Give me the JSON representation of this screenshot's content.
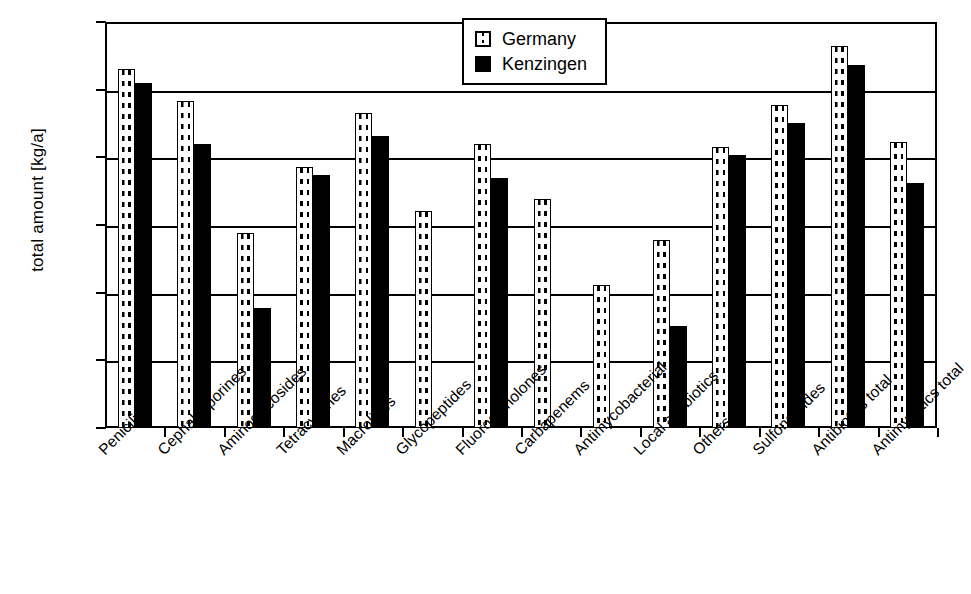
{
  "chart_data": {
    "type": "bar",
    "title": "",
    "xlabel": "",
    "ylabel": "total amount [kg/a]",
    "yscale": "log",
    "ylim": [
      1,
      1000000
    ],
    "yticks": [
      "1",
      "10",
      "100",
      "1000",
      "10000",
      "100000",
      "1000000"
    ],
    "grid": true,
    "legend_position": "top-center",
    "categories": [
      "Penicilins",
      "Cephalosporines",
      "Aminoglycosides",
      "Tetracyclines",
      "Macrolides",
      "Glycopeptides",
      "Fluoroquinolones",
      "Carbapenems",
      "Antimycobacterial",
      "Local antibiotics",
      "Others",
      "Sulfonamides",
      "Antibiotics total",
      "Antimycotics total"
    ],
    "series": [
      {
        "name": "Germany",
        "values": [
          200000,
          68000,
          750,
          7300,
          45000,
          1600,
          16000,
          2400,
          130,
          600,
          14000,
          60000,
          440000,
          17000
        ]
      },
      {
        "name": "Kenzingen",
        "values": [
          125000,
          16000,
          60,
          5400,
          21000,
          null,
          5000,
          null,
          null,
          32,
          11000,
          32000,
          230000,
          4200
        ]
      }
    ]
  },
  "legend": {
    "items": [
      {
        "label": "Germany",
        "swatch": "dotted-pattern-swatch"
      },
      {
        "label": "Kenzingen",
        "swatch": "solid-black-swatch"
      }
    ]
  },
  "colors": {
    "axis": "#000000",
    "germany_fill": "#ffffff",
    "germany_pattern": "#000000",
    "kenzingen_fill": "#000000",
    "background": "#ffffff"
  }
}
